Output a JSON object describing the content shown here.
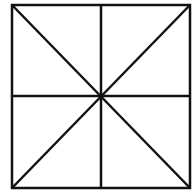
{
  "diagram": {
    "colors": {
      "stroke": "#111111",
      "background": "#ffffff"
    },
    "square": {
      "x1": 12,
      "y1": 5,
      "x2": 190,
      "y2": 188
    },
    "lines": [
      {
        "name": "vertical-midline",
        "x1": 101,
        "y1": 5,
        "x2": 101,
        "y2": 188
      },
      {
        "name": "horizontal-midline",
        "x1": 12,
        "y1": 96,
        "x2": 190,
        "y2": 96
      },
      {
        "name": "diagonal-main",
        "x1": 12,
        "y1": 5,
        "x2": 190,
        "y2": 188
      },
      {
        "name": "diagonal-anti",
        "x1": 190,
        "y1": 5,
        "x2": 12,
        "y2": 188
      }
    ]
  }
}
